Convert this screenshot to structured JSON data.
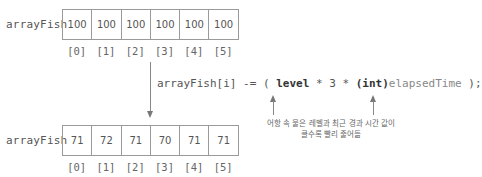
{
  "top_array": {
    "name": "arrayFish",
    "values": [
      "100",
      "100",
      "100",
      "100",
      "100",
      "100"
    ],
    "indices": [
      "[0]",
      "[1]",
      "[2]",
      "[3]",
      "[4]",
      "[5]"
    ]
  },
  "code": {
    "prefix": "arrayFish[i] -= ( ",
    "level": "level",
    "mid": " * 3 * ",
    "cast": "(int)",
    "var": "elapsedTime",
    "suffix": " );"
  },
  "note": {
    "line1": "어항 속 물은 레벨과 최근 경과 시간 값이",
    "line2": "클수록 빨리 줄어듦"
  },
  "bottom_array": {
    "name": "arrayFish",
    "values": [
      "71",
      "72",
      "71",
      "70",
      "71",
      "71"
    ],
    "indices": [
      "[0]",
      "[1]",
      "[2]",
      "[3]",
      "[4]",
      "[5]"
    ]
  },
  "colors": {
    "border": "#9a9a9a",
    "text": "#555555",
    "arrow": "#777777"
  }
}
